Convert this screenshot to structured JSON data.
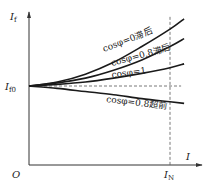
{
  "chart_data": {
    "type": "line",
    "title": "",
    "xlabel": "I",
    "ylabel": "I_f",
    "origin_label": "O",
    "y_ref_label": {
      "main": "I",
      "sub": "f0"
    },
    "x_ref_label": {
      "main": "I",
      "sub": "N"
    },
    "y_axis_label": {
      "main": "I",
      "sub": "f"
    },
    "xlim": [
      0,
      1.1
    ],
    "ylim": [
      0,
      1.85
    ],
    "x_ref": 1.0,
    "y_ref": 1.0,
    "grid": false,
    "series": [
      {
        "name": "cosφ=0滞后",
        "label": "cosφ=0滞后",
        "x": [
          0,
          0.2,
          0.4,
          0.6,
          0.8,
          1.0,
          1.1
        ],
        "y": [
          1.0,
          1.05,
          1.15,
          1.3,
          1.5,
          1.72,
          1.85
        ]
      },
      {
        "name": "cosφ=0.8滞后",
        "label": "cosφ=0.8滞后",
        "x": [
          0,
          0.2,
          0.4,
          0.6,
          0.8,
          1.0,
          1.1
        ],
        "y": [
          1.0,
          1.04,
          1.1,
          1.2,
          1.33,
          1.5,
          1.6
        ]
      },
      {
        "name": "cosφ=1",
        "label": "cosφ=1",
        "x": [
          0,
          0.2,
          0.4,
          0.6,
          0.8,
          1.0,
          1.1
        ],
        "y": [
          1.0,
          1.02,
          1.05,
          1.1,
          1.16,
          1.23,
          1.28
        ]
      },
      {
        "name": "cosφ=0.8超前",
        "label": "cosφ=0.8超前",
        "x": [
          0,
          0.2,
          0.4,
          0.6,
          0.8,
          1.0,
          1.1
        ],
        "y": [
          1.0,
          0.97,
          0.93,
          0.89,
          0.84,
          0.8,
          0.78
        ]
      }
    ]
  }
}
